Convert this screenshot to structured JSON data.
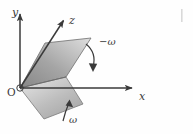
{
  "figure": {
    "background_color": "#fefefe",
    "stroke_color": "#3a3a3a",
    "axes": [
      {
        "id": "y",
        "label": "y",
        "label_x": 15,
        "label_y": 16,
        "from_x": 20,
        "from_y": 88,
        "to_x": 20,
        "to_y": 12
      },
      {
        "id": "z",
        "label": "z",
        "label_x": 69,
        "label_y": 24,
        "from_x": 20,
        "from_y": 88,
        "to_x": 62,
        "to_y": 19
      },
      {
        "id": "x",
        "label": "x",
        "label_x": 139,
        "label_y": 100,
        "from_x": 20,
        "from_y": 88,
        "to_x": 134,
        "to_y": 88
      }
    ],
    "origin": {
      "label": "O",
      "x": 11,
      "y": 93,
      "marker_x": 20,
      "marker_y": 88,
      "marker_r": 3.2
    },
    "planes": [
      {
        "id": "upper-half-plane",
        "name": "rotated-half-plane",
        "points": "20,88 45,43 91,38 66,77",
        "fill_light": "#d8d8d8",
        "fill_dark": "#8e8e8e"
      },
      {
        "id": "lower-half-plane",
        "name": "reference-half-plane",
        "points": "20,88 66,77 83,104 44,119",
        "fill_light": "#e2e2e2",
        "fill_dark": "#a8a8a8"
      }
    ],
    "annotations": [
      {
        "id": "minus-omega",
        "label": "−ω",
        "label_x": 101,
        "label_y": 44,
        "arrow_path": "M 86,44 Q 97,53 93,67",
        "arrow_tip": "93,71 89.6,63.6 96.6,63.6",
        "direction": "clockwise-down"
      },
      {
        "id": "omega",
        "label": "ω",
        "label_x": 72,
        "label_y": 120,
        "arrow_path": "M 63,120 Q 66,110 69,103",
        "arrow_tip": "70,99 73.2,106.6 66.1,105.3",
        "direction": "counterclockwise-up"
      }
    ],
    "edge_lines": [
      {
        "id": "plane-intersection-edge",
        "x1": 20,
        "y1": 88,
        "x2": 66,
        "y2": 77
      },
      {
        "id": "upper-plane-right-edge",
        "x1": 66,
        "y1": 77,
        "x2": 91,
        "y2": 38
      },
      {
        "id": "upper-plane-top-edge",
        "x1": 45,
        "y1": 43,
        "x2": 91,
        "y2": 38
      },
      {
        "id": "upper-plane-left-edge",
        "x1": 20,
        "y1": 88,
        "x2": 45,
        "y2": 43
      },
      {
        "id": "lower-plane-bottom-edge",
        "x1": 44,
        "y1": 119,
        "x2": 83,
        "y2": 104
      },
      {
        "id": "lower-plane-right-edge",
        "x1": 83,
        "y1": 104,
        "x2": 66,
        "y2": 77
      },
      {
        "id": "lower-plane-left-edge",
        "x1": 20,
        "y1": 88,
        "x2": 44,
        "y2": 119
      }
    ],
    "corner_mark": {
      "id": "scan-artifact",
      "x": 181,
      "y": 9,
      "width": 2,
      "height": 14
    }
  }
}
